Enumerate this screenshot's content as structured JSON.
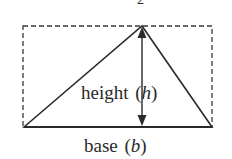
{
  "diagram": {
    "type": "triangle-area",
    "top_label_partial": "2",
    "height_label": {
      "word": "height",
      "symbol": "h"
    },
    "base_label": {
      "word": "base",
      "symbol": "b"
    },
    "colors": {
      "stroke": "#2a2a2a",
      "dashed": "#3a3a3a",
      "background": "#ffffff"
    }
  }
}
